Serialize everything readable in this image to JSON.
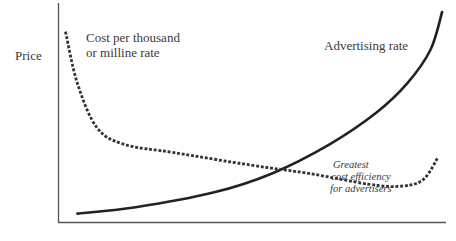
{
  "chart_data": {
    "type": "line",
    "title": "",
    "xlabel": "",
    "ylabel": "Price",
    "grid": false,
    "legend": "none (curves labeled directly)",
    "x_ticks": [],
    "y_ticks": [],
    "xlim": [
      0,
      100
    ],
    "ylim": [
      0,
      100
    ],
    "series": [
      {
        "name": "Advertising rate",
        "style": "solid",
        "color": "#222222",
        "x": [
          5,
          20,
          40,
          55,
          70,
          82,
          90,
          96,
          99
        ],
        "y": [
          4,
          7,
          14,
          23,
          37,
          52,
          66,
          82,
          100
        ],
        "label_text": "Advertising rate"
      },
      {
        "name": "Cost per thousand or milline rate",
        "style": "dotted",
        "color": "#333333",
        "x": [
          2,
          5,
          10,
          17,
          30,
          50,
          65,
          80,
          88,
          94,
          98
        ],
        "y": [
          90,
          66,
          45,
          37,
          33,
          27,
          23,
          18,
          17,
          20,
          31
        ],
        "label_text": "Cost per thousand or milline rate"
      }
    ],
    "annotations": [
      {
        "text": "Greatest cost efficiency for advertisers",
        "italic": true,
        "x": 80,
        "y": 32
      }
    ]
  },
  "labels": {
    "y_axis": "Price",
    "cpm_line1": "Cost per thousand",
    "cpm_line2": "or milline rate",
    "ad_rate": "Advertising rate",
    "ann_line1": "Greatest",
    "ann_line2": "cost efficiency",
    "ann_line3": "for advertisers"
  }
}
